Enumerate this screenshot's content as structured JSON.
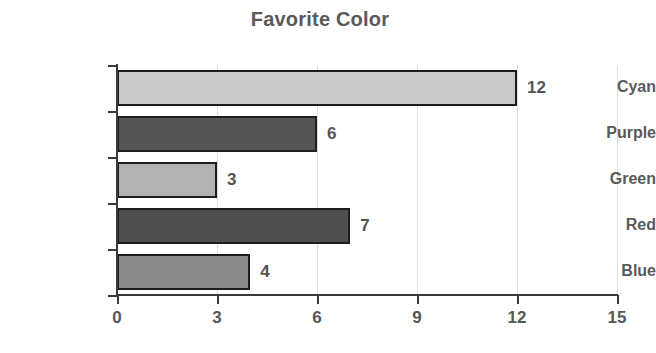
{
  "chart_data": {
    "type": "bar",
    "orientation": "horizontal",
    "title": "Favorite Color",
    "xlabel": "",
    "ylabel": "",
    "categories": [
      "Cyan",
      "Purple",
      "Green",
      "Red",
      "Blue"
    ],
    "values": [
      12,
      6,
      3,
      7,
      4
    ],
    "value_labels": [
      "12",
      "6",
      "3",
      "7",
      "4"
    ],
    "bar_colors": [
      "#c9c9c9",
      "#555555",
      "#b2b2b2",
      "#4f4f4f",
      "#8a8a8a"
    ],
    "bar_edge_color": "#1d1d1d",
    "xlim": [
      0,
      15
    ],
    "xticks": [
      0,
      3,
      6,
      9,
      12,
      15
    ],
    "xtick_labels": [
      "0",
      "3",
      "6",
      "9",
      "12",
      "15"
    ],
    "grid": true,
    "grid_axis": "x",
    "grid_color": "#dedede",
    "legend": false,
    "title_color": "#5a5a5a",
    "tick_label_color": "#565656",
    "axis_color": "#3a3a3a",
    "background": "#ffffff"
  }
}
